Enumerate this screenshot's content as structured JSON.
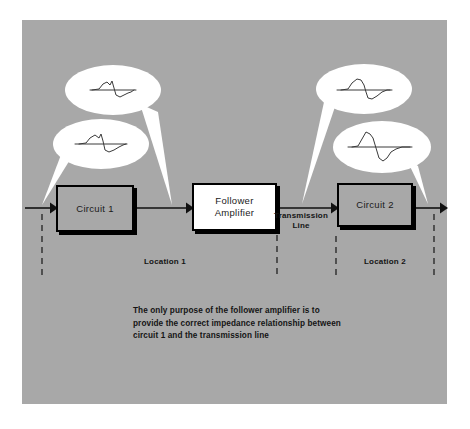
{
  "figure": {
    "panel_color": "#a8a8a8",
    "ink_color": "#000000",
    "bubble_color": "#ffffff"
  },
  "blocks": [
    {
      "id": "circuit1",
      "label_line1": "Circuit 1",
      "label_line2": "",
      "fill": "#a8a8a8"
    },
    {
      "id": "follower_amplifier",
      "label_line1": "Follower",
      "label_line2": "Amplifier",
      "fill": "#ffffff"
    },
    {
      "id": "circuit2",
      "label_line1": "Circuit 2",
      "label_line2": "",
      "fill": "#a8a8a8"
    }
  ],
  "labels": {
    "transmission_line": "Transmission Line",
    "location_1": "Location 1",
    "location_2": "Location 2"
  },
  "caption": {
    "line1": "The only purpose of the follower amplifier is to",
    "line2": "provide the correct impedance relationship between",
    "line3": "circuit 1 and the transmission line"
  },
  "callouts": [
    {
      "id": "callout-top-left",
      "name": "waveform-callout-circuit1-output",
      "points_to": "follower-amplifier-input",
      "waveform": "small-irregular-pulse"
    },
    {
      "id": "callout-bottom-left",
      "name": "waveform-callout-circuit1-input",
      "points_to": "circuit1-input-arrow",
      "waveform": "small-irregular-pulse"
    },
    {
      "id": "callout-top-right",
      "name": "waveform-callout-transmission-line",
      "points_to": "circuit2-input-arrow",
      "waveform": "medium-irregular-pulse"
    },
    {
      "id": "callout-bottom-right",
      "name": "waveform-callout-circuit2-output",
      "points_to": "circuit2-output-arrow",
      "waveform": "large-irregular-pulse"
    }
  ],
  "dashed_markers": [
    {
      "id": "marker-1",
      "x": 42
    },
    {
      "id": "marker-2",
      "x": 277
    },
    {
      "id": "marker-3",
      "x": 336
    },
    {
      "id": "marker-4",
      "x": 434
    }
  ],
  "signal_path": {
    "description": "left input arrow to Circuit 1 to Follower Amplifier to transmission line to Circuit 2 to right output arrow"
  }
}
